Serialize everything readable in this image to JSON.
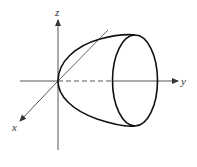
{
  "diagram": {
    "type": "3d-surface",
    "axes": {
      "x": {
        "label": "x"
      },
      "y": {
        "label": "y"
      },
      "z": {
        "label": "z"
      }
    },
    "colors": {
      "axis": "#555555",
      "surface": "#111111",
      "label": "#333333",
      "background": "#ffffff"
    }
  }
}
